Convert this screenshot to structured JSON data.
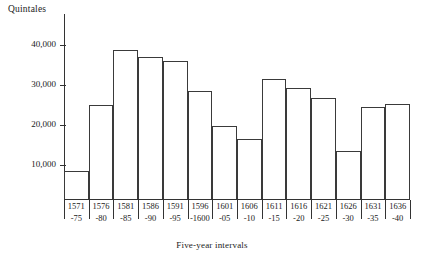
{
  "chart_data": {
    "type": "bar",
    "title": "",
    "ylabel": "Quintales",
    "xlabel": "Five-year intervals",
    "ylim": [
      0,
      44000
    ],
    "yticks": [
      10000,
      20000,
      30000,
      40000
    ],
    "ytick_labels": [
      "10,000",
      "20,000",
      "30,000",
      "40,000"
    ],
    "grid": false,
    "legend": null,
    "categories": [
      "1571-75",
      "1576-80",
      "1581-85",
      "1586-90",
      "1591-95",
      "1596-1600",
      "1601-05",
      "1606-10",
      "1611-15",
      "1616-20",
      "1621-25",
      "1626-30",
      "1631-35",
      "1636-40"
    ],
    "category_lines": [
      {
        "top": "1571",
        "bottom": "-75"
      },
      {
        "top": "1576",
        "bottom": "-80"
      },
      {
        "top": "1581",
        "bottom": "-85"
      },
      {
        "top": "1586",
        "bottom": "-90"
      },
      {
        "top": "1591",
        "bottom": "-95"
      },
      {
        "top": "1596",
        "bottom": "-1600"
      },
      {
        "top": "1601",
        "bottom": "-05"
      },
      {
        "top": "1606",
        "bottom": "-10"
      },
      {
        "top": "1611",
        "bottom": "-15"
      },
      {
        "top": "1616",
        "bottom": "-20"
      },
      {
        "top": "1621",
        "bottom": "-25"
      },
      {
        "top": "1626",
        "bottom": "-30"
      },
      {
        "top": "1631",
        "bottom": "-35"
      },
      {
        "top": "1636",
        "bottom": "-40"
      }
    ],
    "values": [
      8600,
      25000,
      38800,
      37100,
      36100,
      28400,
      19700,
      16500,
      31400,
      29300,
      26700,
      13500,
      24400,
      25200
    ]
  },
  "style": {
    "bar_stroke": "#3a3a3a",
    "axis_color": "#333333",
    "text_color": "#1a1a1a",
    "background": "#ffffff"
  }
}
